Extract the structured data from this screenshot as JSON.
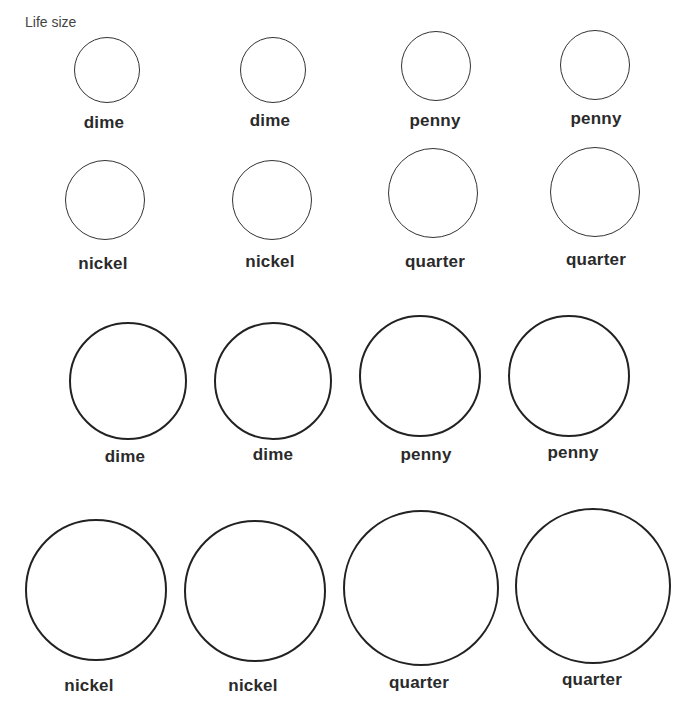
{
  "page": {
    "caption": "Life size"
  },
  "coins": [
    {
      "label": "dime",
      "cx": 107,
      "cy": 70,
      "r": 33,
      "style": "small",
      "label_x": 104,
      "label_y": 113
    },
    {
      "label": "dime",
      "cx": 273,
      "cy": 70,
      "r": 33,
      "style": "small",
      "label_x": 270,
      "label_y": 111
    },
    {
      "label": "penny",
      "cx": 436,
      "cy": 66,
      "r": 35,
      "style": "small",
      "label_x": 435,
      "label_y": 111
    },
    {
      "label": "penny",
      "cx": 595,
      "cy": 65,
      "r": 35,
      "style": "small",
      "label_x": 596,
      "label_y": 109
    },
    {
      "label": "nickel",
      "cx": 105,
      "cy": 200,
      "r": 40,
      "style": "small",
      "label_x": 103,
      "label_y": 254
    },
    {
      "label": "nickel",
      "cx": 272,
      "cy": 200,
      "r": 40,
      "style": "small",
      "label_x": 270,
      "label_y": 252
    },
    {
      "label": "quarter",
      "cx": 433,
      "cy": 193,
      "r": 45,
      "style": "small",
      "label_x": 435,
      "label_y": 252
    },
    {
      "label": "quarter",
      "cx": 595,
      "cy": 192,
      "r": 45,
      "style": "small",
      "label_x": 596,
      "label_y": 250
    },
    {
      "label": "dime",
      "cx": 128,
      "cy": 381,
      "r": 59,
      "style": "large",
      "label_x": 125,
      "label_y": 447
    },
    {
      "label": "dime",
      "cx": 273,
      "cy": 381,
      "r": 59,
      "style": "large",
      "label_x": 273,
      "label_y": 445
    },
    {
      "label": "penny",
      "cx": 420,
      "cy": 376,
      "r": 61,
      "style": "large",
      "label_x": 426,
      "label_y": 445
    },
    {
      "label": "penny",
      "cx": 569,
      "cy": 376,
      "r": 61,
      "style": "large",
      "label_x": 573,
      "label_y": 443
    },
    {
      "label": "nickel",
      "cx": 96,
      "cy": 590,
      "r": 71,
      "style": "large",
      "label_x": 89,
      "label_y": 676
    },
    {
      "label": "nickel",
      "cx": 255,
      "cy": 591,
      "r": 71,
      "style": "large",
      "label_x": 253,
      "label_y": 676
    },
    {
      "label": "quarter",
      "cx": 421,
      "cy": 588,
      "r": 78,
      "style": "large",
      "label_x": 419,
      "label_y": 673
    },
    {
      "label": "quarter",
      "cx": 593,
      "cy": 586,
      "r": 78,
      "style": "large",
      "label_x": 592,
      "label_y": 670
    }
  ]
}
